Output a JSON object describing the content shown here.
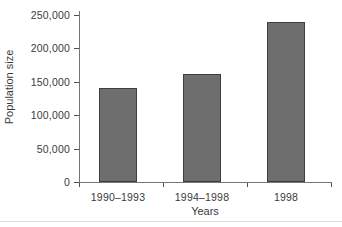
{
  "chart_data": {
    "type": "bar",
    "title": "",
    "categories": [
      "1990–1993",
      "1994–1998",
      "1998"
    ],
    "values": [
      140000,
      162000,
      240000
    ],
    "xlabel": "Years",
    "ylabel": "Population size",
    "ylim": [
      0,
      250000
    ],
    "ytick_step": 50000,
    "ytick_labels": [
      "0",
      "50,000",
      "100,000",
      "150,000",
      "200,000",
      "250,000"
    ],
    "grid": false,
    "legend": "none",
    "colors": {
      "bar_fill": "#6e6e6e",
      "bar_border": "#3e3e3e",
      "axis": "#767676",
      "text": "#3a3a3a"
    }
  }
}
